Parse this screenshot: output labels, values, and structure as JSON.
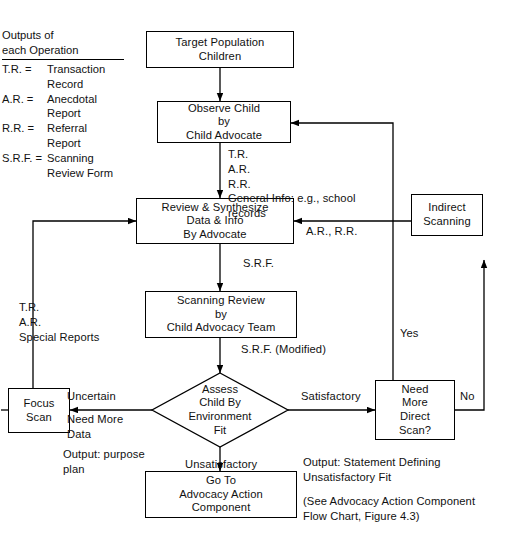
{
  "figure": {
    "type": "flowchart"
  },
  "legend": {
    "heading": "Outputs of\neach Operation",
    "entries": [
      {
        "key": "T.R. =",
        "value": "Transaction\nRecord"
      },
      {
        "key": "A.R. =",
        "value": "Anecdotal\nReport"
      },
      {
        "key": "R.R. =",
        "value": "Referral\nReport"
      },
      {
        "key": "S.R.F. =",
        "value": "Scanning\nReview Form"
      }
    ]
  },
  "nodes": {
    "target_population": "Target Population\nChildren",
    "observe_child": "Observe Child\nby\nChild Advocate",
    "review_synthesize": "Review & Synthesize\nData & Info\nBy Advocate",
    "scanning_review": "Scanning Review\nby\nChild Advocacy Team",
    "assess_fit": "Assess\nChild By\nEnvironment\nFit",
    "indirect_scanning": "Indirect\nScanning",
    "focus_scan": "Focus\nScan",
    "need_more_direct_scan": "Need\nMore\nDirect\nScan?",
    "go_to_advocacy": "Go To\nAdvocacy Action\nComponent"
  },
  "edge_labels": {
    "observe_outputs": "T.R.\nA.R.\nR.R.\nGeneral Info: e.g., school\n            records",
    "srf": "S.R.F.",
    "ar_rr": "A.R., R.R.",
    "srf_modified": "S.R.F. (Modified)",
    "focus_outputs": "T.R.\nA.R.\nSpecial Reports",
    "uncertain": "Uncertain",
    "need_more_data": "Need More\n     Data",
    "output_purpose_plan": "Output: purpose\n            plan",
    "satisfactory": "Satisfactory",
    "unsatisfactory": "Unsatisfactory",
    "yes": "Yes",
    "no": "No"
  },
  "annotations": {
    "output_statement": "Output:   Statement Defining\n              Unsatisfactory Fit",
    "see_reference": "(See Advocacy Action Component\nFlow Chart, Figure 4.3)"
  },
  "colors": {
    "ink": "#000000",
    "paper": "#ffffff"
  }
}
